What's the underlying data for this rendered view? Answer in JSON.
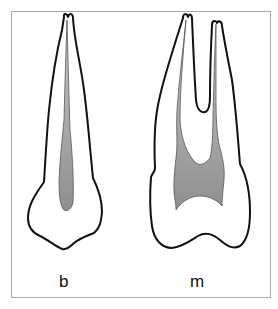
{
  "figure": {
    "type": "dental cross-section diagram",
    "panels": [
      {
        "id": "b",
        "label": "b",
        "description": "single-rooted tooth, buccal view, narrow pulp canal"
      },
      {
        "id": "m",
        "label": "m",
        "description": "two-rooted tooth, mesial view, wide pulp chamber"
      }
    ],
    "colors": {
      "outline": "#111111",
      "pulp_fill": "#9a9a9a",
      "background": "#ffffff",
      "frame": "#a9a9a9"
    }
  }
}
